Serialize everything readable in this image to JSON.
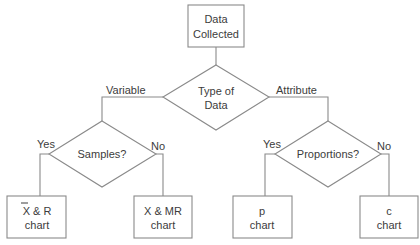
{
  "diagram": {
    "type": "flowchart",
    "colors": {
      "line": "#8a8a8a",
      "text": "#3c3c3c",
      "background": "#ffffff"
    },
    "nodes": {
      "start": {
        "shape": "box",
        "line1": "Data",
        "line2": "Collected"
      },
      "type_decision": {
        "shape": "diamond",
        "line1": "Type of",
        "line2": "Data"
      },
      "samples_decision": {
        "shape": "diamond",
        "label": "Samples?"
      },
      "proportions_decision": {
        "shape": "diamond",
        "label": "Proportions?"
      },
      "xbar_r": {
        "shape": "box",
        "line1": "X & R",
        "line2": "chart",
        "overline_on": "X"
      },
      "x_mr": {
        "shape": "box",
        "line1": "X & MR",
        "line2": "chart"
      },
      "p_chart": {
        "shape": "box",
        "line1": "p",
        "line2": "chart"
      },
      "c_chart": {
        "shape": "box",
        "line1": "c",
        "line2": "chart"
      }
    },
    "edges": {
      "variable": "Variable",
      "attribute": "Attribute",
      "samples_yes": "Yes",
      "samples_no": "No",
      "proportions_yes": "Yes",
      "proportions_no": "No"
    }
  }
}
